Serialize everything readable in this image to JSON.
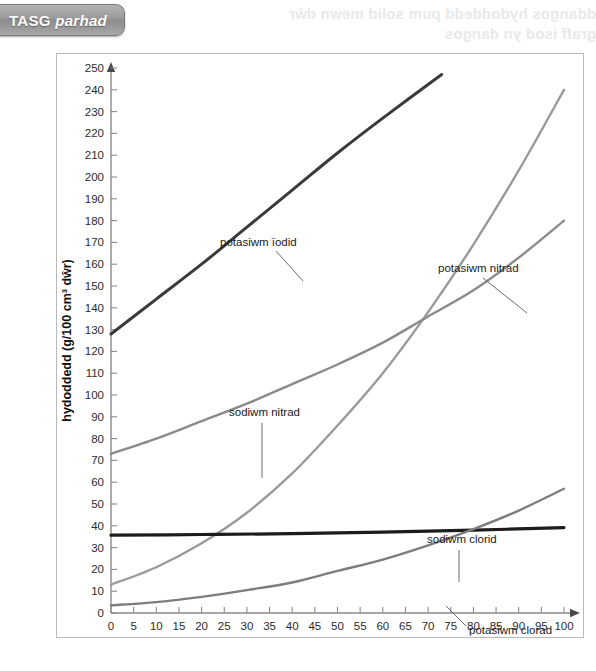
{
  "banner": {
    "label_main": "TASG",
    "label_italic": "parhad"
  },
  "ghost": {
    "line1": "ddangos hydoddedd pum solid mewn dŵr",
    "line2": "graff isod  yn  dangos"
  },
  "chart_data": {
    "type": "line",
    "title": "",
    "xlabel": "tymheredd (°C)",
    "ylabel": "hydoddedd (g/100 cm³ dŵr)",
    "xlim": [
      0,
      100
    ],
    "ylim": [
      0,
      250
    ],
    "xticks": [
      0,
      5,
      10,
      15,
      20,
      25,
      30,
      35,
      40,
      45,
      50,
      55,
      60,
      65,
      70,
      75,
      80,
      85,
      90,
      95,
      100
    ],
    "yticks": [
      0,
      10,
      20,
      30,
      40,
      50,
      60,
      70,
      80,
      90,
      100,
      110,
      120,
      130,
      140,
      150,
      160,
      170,
      180,
      190,
      200,
      210,
      220,
      230,
      240,
      250
    ],
    "grid": false,
    "legend": "inline-annotations",
    "series": [
      {
        "name": "potasiwm ïodid",
        "color": "#3a3a3a",
        "width": 3.0,
        "x": [
          0,
          10,
          20,
          30,
          40,
          50,
          60,
          73
        ],
        "values": [
          128,
          144,
          160,
          177,
          194,
          211,
          227,
          247
        ]
      },
      {
        "name": "potasiwm nitrad",
        "color": "#9a9a9a",
        "width": 2.4,
        "x": [
          0,
          10,
          20,
          30,
          40,
          50,
          60,
          70,
          80,
          90,
          100
        ],
        "values": [
          13,
          21,
          32,
          46,
          64,
          86,
          110,
          138,
          169,
          203,
          240
        ]
      },
      {
        "name": "sodiwm nitrad",
        "color": "#8a8a8a",
        "width": 2.4,
        "x": [
          0,
          10,
          20,
          30,
          40,
          50,
          60,
          70,
          80,
          90,
          100
        ],
        "values": [
          73,
          80,
          88,
          96,
          105,
          114,
          124,
          136,
          148,
          163,
          180
        ]
      },
      {
        "name": "sodiwm clorid",
        "color": "#1c1c1c",
        "width": 3.2,
        "x": [
          0,
          20,
          40,
          60,
          80,
          100
        ],
        "values": [
          35.7,
          36.0,
          36.4,
          37.1,
          38.0,
          39.2
        ]
      },
      {
        "name": "potasiwm clorad",
        "color": "#7d7d7d",
        "width": 2.4,
        "x": [
          0,
          10,
          20,
          30,
          40,
          50,
          60,
          70,
          80,
          90,
          100
        ],
        "values": [
          3.5,
          5.0,
          7.4,
          10.5,
          14.0,
          19.3,
          24.5,
          31.0,
          38.5,
          47.0,
          57.0
        ]
      }
    ],
    "annotations": [
      {
        "id": "ann-potasiwm-iodid",
        "text": "potasiwm ïodid",
        "tx": 163,
        "ty": 192,
        "lx1": 219,
        "ly1": 197,
        "lx2": 246,
        "ly2": 227
      },
      {
        "id": "ann-potasiwm-nitrad",
        "text": "potasiwm nitrad",
        "tx": 381,
        "ty": 218,
        "lx1": 426,
        "ly1": 224,
        "lx2": 470,
        "ly2": 259
      },
      {
        "id": "ann-sodiwm-nitrad",
        "text": "sodiwm nitrad",
        "tx": 172,
        "ty": 362,
        "lx1": 205,
        "ly1": 369,
        "lx2": 205,
        "ly2": 424
      },
      {
        "id": "ann-sodiwm-clorid",
        "text": "sodiwm clorid",
        "tx": 370,
        "ty": 489,
        "lx1": 402,
        "ly1": 496,
        "lx2": 402,
        "ly2": 528
      },
      {
        "id": "ann-potasiwm-clorad",
        "text": "potasiwm clorad",
        "tx": 412,
        "ty": 580,
        "lx1": 409,
        "ly1": 572,
        "lx2": 389,
        "ly2": 552
      }
    ]
  }
}
